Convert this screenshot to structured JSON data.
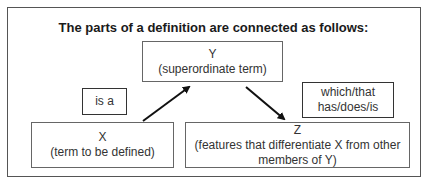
{
  "title": "The parts of a definition are connected as follows:",
  "nodes": {
    "y": {
      "letter": "Y",
      "description": "(superordinate term)"
    },
    "x": {
      "letter": "X",
      "description": "(term to be defined)"
    },
    "z": {
      "letter": "Z",
      "description_line1": "(features that differentiate X from other",
      "description_line2": "members of Y)"
    }
  },
  "connectors": {
    "is_a": "is a",
    "which_line1": "which/that",
    "which_line2": "has/does/is"
  },
  "edges": [
    {
      "from": "X",
      "to": "Y",
      "label": "is a"
    },
    {
      "from": "Y",
      "to": "Z",
      "label": "which/that has/does/is"
    }
  ]
}
